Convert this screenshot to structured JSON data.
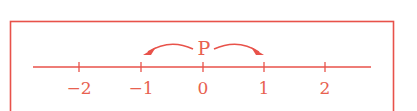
{
  "diagram": {
    "color": "#e8524a",
    "text_color": "#e8614f",
    "point": {
      "label": "P",
      "position": 0
    },
    "arrows": [
      {
        "from": 0,
        "to": -1,
        "direction": "left"
      },
      {
        "from": 0,
        "to": 1,
        "direction": "right"
      }
    ],
    "ticks": [
      {
        "value": -2,
        "label": "−2"
      },
      {
        "value": -1,
        "label": "−1"
      },
      {
        "value": 0,
        "label": "0"
      },
      {
        "value": 1,
        "label": "1"
      },
      {
        "value": 2,
        "label": "2"
      }
    ]
  }
}
